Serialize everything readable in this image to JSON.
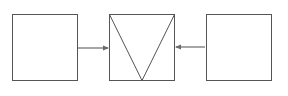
{
  "diagram": {
    "stroke_color": "#555555",
    "arrow_color": "#6a6a6a",
    "boxes": [
      {
        "id": "left-box",
        "x": 12,
        "y": 14,
        "w": 65,
        "h": 66
      },
      {
        "id": "center-box",
        "x": 109,
        "y": 14,
        "w": 65,
        "h": 66,
        "inner_shape": "inverted-triangle"
      },
      {
        "id": "right-box",
        "x": 206,
        "y": 14,
        "w": 65,
        "h": 66
      }
    ],
    "arrows": [
      {
        "id": "left-to-center",
        "from": "left-box",
        "to": "center-box",
        "direction": "right"
      },
      {
        "id": "right-to-center",
        "from": "right-box",
        "to": "center-box",
        "direction": "left"
      }
    ]
  }
}
